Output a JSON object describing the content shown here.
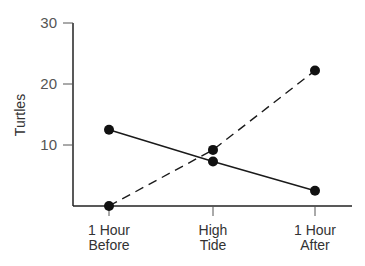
{
  "chart_data": {
    "type": "line",
    "title": "",
    "xlabel": "",
    "ylabel": "Turtles",
    "ylim": [
      0,
      30
    ],
    "yticks": [
      10,
      20,
      30
    ],
    "ytick_labels": [
      "10",
      "20",
      "30"
    ],
    "categories": [
      [
        "1 Hour",
        "Before"
      ],
      [
        "High",
        "Tide"
      ],
      [
        "1 Hour",
        "After"
      ]
    ],
    "grid": false,
    "legend": null,
    "series": [
      {
        "name": "solid",
        "line_style": "solid",
        "marker": "filled-circle",
        "values": [
          12.5,
          7.3,
          2.5
        ]
      },
      {
        "name": "dashed",
        "line_style": "dashed",
        "marker": "filled-circle",
        "values": [
          0,
          9.2,
          22.2
        ]
      }
    ]
  }
}
